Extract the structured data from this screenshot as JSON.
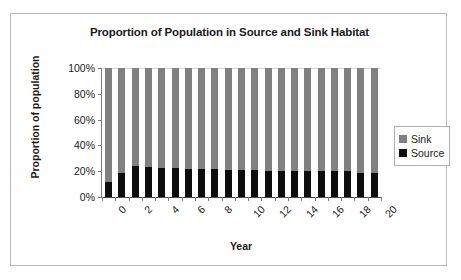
{
  "chart_data": {
    "type": "bar",
    "subtype": "stacked-100-percent",
    "title": "Proportion of Population in Source and Sink Habitat",
    "xlabel": "Year",
    "ylabel": "Proportion of population",
    "x": [
      0,
      1,
      2,
      3,
      4,
      5,
      6,
      7,
      8,
      9,
      10,
      11,
      12,
      13,
      14,
      15,
      16,
      17,
      18,
      19,
      20
    ],
    "categories": [
      "0",
      "1",
      "2",
      "3",
      "4",
      "5",
      "6",
      "7",
      "8",
      "9",
      "10",
      "11",
      "12",
      "13",
      "14",
      "15",
      "16",
      "17",
      "18",
      "19",
      "20"
    ],
    "xtick_labels": [
      "0",
      "2",
      "4",
      "6",
      "8",
      "10",
      "12",
      "14",
      "16",
      "18",
      "20"
    ],
    "xtick_values": [
      0,
      2,
      4,
      6,
      8,
      10,
      12,
      14,
      16,
      18,
      20
    ],
    "ytick_labels": [
      "0%",
      "20%",
      "40%",
      "60%",
      "80%",
      "100%"
    ],
    "ytick_values": [
      0,
      20,
      40,
      60,
      80,
      100
    ],
    "ylim": [
      0,
      100
    ],
    "grid": false,
    "legend_position": "right",
    "series": [
      {
        "name": "Source",
        "color": "#0d0d0d",
        "values": [
          12,
          19,
          24,
          23,
          22.5,
          22.5,
          22,
          21.5,
          21.5,
          21,
          21,
          21,
          20.5,
          20,
          20,
          20,
          20,
          20,
          20,
          19,
          19
        ]
      },
      {
        "name": "Sink",
        "color": "#808080",
        "values": [
          88,
          81,
          76,
          77,
          77.5,
          77.5,
          78,
          78.5,
          78.5,
          79,
          79,
          79,
          79.5,
          80,
          80,
          80,
          80,
          80,
          80,
          81,
          81
        ]
      }
    ]
  },
  "legend": {
    "items": [
      {
        "label": "Sink",
        "color": "#808080"
      },
      {
        "label": "Source",
        "color": "#0d0d0d"
      }
    ]
  }
}
